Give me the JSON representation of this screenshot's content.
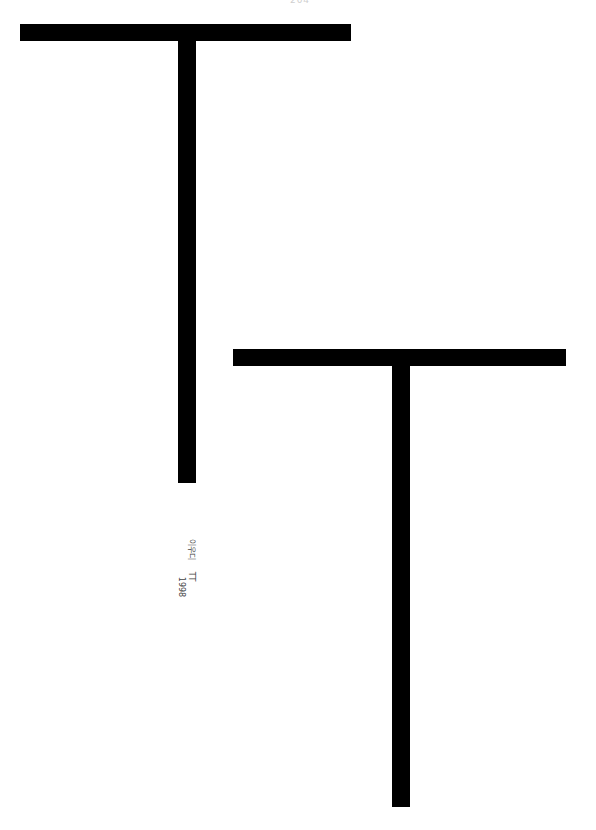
{
  "page": {
    "number": "204",
    "background": "#ffffff"
  },
  "shapes": [
    {
      "name": "letter-t-1",
      "color": "#000000",
      "crossbar": {
        "x": 20,
        "y": 24,
        "w": 331,
        "h": 17
      },
      "stem": {
        "x": 178,
        "y": 41,
        "w": 18,
        "h": 442
      }
    },
    {
      "name": "letter-t-2",
      "color": "#000000",
      "crossbar": {
        "x": 233,
        "y": 349,
        "w": 333,
        "h": 17
      },
      "stem": {
        "x": 392,
        "y": 366,
        "w": 18,
        "h": 441
      }
    }
  ],
  "caption": {
    "author": "이우디",
    "title": "TT",
    "year": "1998"
  }
}
